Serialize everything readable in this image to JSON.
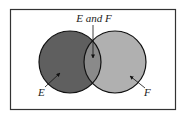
{
  "diagram": {
    "type": "venn",
    "labels": {
      "intersection": "E and F",
      "left": "E",
      "right": "F"
    },
    "colors": {
      "left_fill": "#5f5f5f",
      "right_fill": "#b0b0b0",
      "intersection_fill": "#8a8a8a",
      "stroke": "#111111",
      "frame": "#333333",
      "background": "#ffffff"
    }
  }
}
